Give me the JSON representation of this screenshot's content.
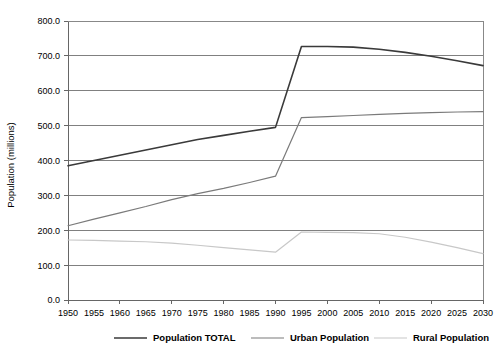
{
  "chart_data": {
    "type": "line",
    "title": "",
    "subtitle": "",
    "xlabel": "",
    "ylabel": "Population (millions)",
    "ylim": [
      0,
      800
    ],
    "ytick_step": 100,
    "ytick_labels": [
      "0.0",
      "100.0",
      "200.0",
      "300.0",
      "400.0",
      "500.0",
      "600.0",
      "700.0",
      "800.0"
    ],
    "grid": true,
    "legend_position": "bottom",
    "x": [
      1950,
      1955,
      1960,
      1965,
      1970,
      1975,
      1980,
      1985,
      1990,
      1995,
      2000,
      2005,
      2010,
      2015,
      2020,
      2025,
      2030
    ],
    "xtick_labels": [
      "1950",
      "1955",
      "1960",
      "1965",
      "1970",
      "1975",
      "1980",
      "1985",
      "1990",
      "1995",
      "2000",
      "2005",
      "2010",
      "2015",
      "2020",
      "2025",
      "2030"
    ],
    "series": [
      {
        "name": "Population TOTAL",
        "color": "#3a3a3a",
        "width": 1.6,
        "values": [
          385,
          400,
          415,
          430,
          445,
          460,
          472,
          484,
          495,
          727,
          727,
          725,
          719,
          710,
          699,
          686,
          672
        ]
      },
      {
        "name": "Urban Population",
        "color": "#7a7a7a",
        "width": 1.2,
        "values": [
          213,
          232,
          250,
          268,
          288,
          305,
          320,
          337,
          355,
          523,
          526,
          529,
          532,
          535,
          537,
          539,
          540
        ]
      },
      {
        "name": "Rural Population",
        "color": "#c8c8c8",
        "width": 1.2,
        "values": [
          172,
          171,
          169,
          167,
          163,
          157,
          150,
          144,
          137,
          195,
          194,
          193,
          190,
          180,
          166,
          150,
          133
        ]
      }
    ],
    "legend": [
      {
        "label": "Population TOTAL",
        "color": "#3a3a3a"
      },
      {
        "label": "Urban Population",
        "color": "#7a7a7a"
      },
      {
        "label": "Rural Population",
        "color": "#c8c8c8"
      }
    ],
    "colors": {
      "total": "#3a3a3a",
      "urban": "#7a7a7a",
      "rural": "#c8c8c8",
      "grid": "#808080",
      "axis": "#666666",
      "background": "#ffffff"
    }
  }
}
